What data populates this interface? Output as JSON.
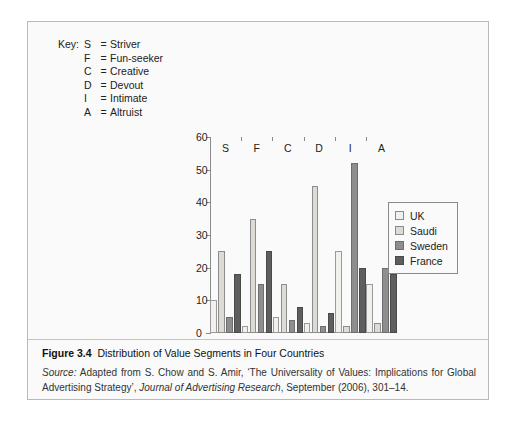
{
  "key": {
    "lead_label": "Key:",
    "entries": [
      {
        "letter": "S",
        "eq": "=",
        "name": "Striver"
      },
      {
        "letter": "F",
        "eq": "=",
        "name": "Fun-seeker"
      },
      {
        "letter": "C",
        "eq": "=",
        "name": "Creative"
      },
      {
        "letter": "D",
        "eq": "=",
        "name": "Devout"
      },
      {
        "letter": "I",
        "eq": "=",
        "name": "Intimate"
      },
      {
        "letter": "A",
        "eq": "=",
        "name": "Altruist"
      }
    ]
  },
  "legend": {
    "position": "right-inside",
    "items": [
      {
        "label": "UK",
        "color": "#f2f0ec"
      },
      {
        "label": "Saudi",
        "color": "#dedbd4"
      },
      {
        "label": "Sweden",
        "color": "#8e8e8e"
      },
      {
        "label": "France",
        "color": "#5e5e5e"
      }
    ]
  },
  "caption": {
    "figure_number": "Figure 3.4",
    "title": "Distribution of Value Segments in Four Countries",
    "source_word": "Source:",
    "source_text_1": " Adapted from S. Chow and S. Amir, ‘The Universality of Values: Implications for Global Advertising Strategy’, ",
    "journal": "Journal of Advertising Research",
    "source_text_2": ", September (2006), 301–14."
  },
  "chart_data": {
    "type": "bar",
    "title": "Distribution of Value Segments in Four Countries",
    "xlabel": "",
    "ylabel": "",
    "categories": [
      "S",
      "F",
      "C",
      "D",
      "I",
      "A"
    ],
    "category_names": [
      "Striver",
      "Fun-seeker",
      "Creative",
      "Devout",
      "Intimate",
      "Altruist"
    ],
    "ylim": [
      0,
      60
    ],
    "yticks": [
      0,
      10,
      20,
      30,
      40,
      50,
      60
    ],
    "grid": false,
    "legend_position": "right-inside",
    "series": [
      {
        "name": "UK",
        "color": "#f2f0ec",
        "values": [
          10,
          2,
          5,
          3,
          25,
          15
        ]
      },
      {
        "name": "Saudi",
        "color": "#dedbd4",
        "values": [
          25,
          35,
          15,
          45,
          2,
          3
        ]
      },
      {
        "name": "Sweden",
        "color": "#8e8e8e",
        "values": [
          5,
          15,
          4,
          2,
          52,
          20
        ]
      },
      {
        "name": "France",
        "color": "#5e5e5e",
        "values": [
          18,
          25,
          8,
          6,
          20,
          18
        ]
      }
    ]
  }
}
